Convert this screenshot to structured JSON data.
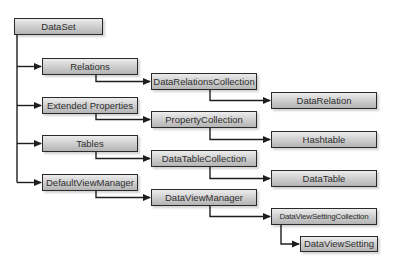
{
  "diagram": {
    "nodes": [
      {
        "id": "dataset",
        "label": "DataSet"
      },
      {
        "id": "relations",
        "label": "Relations"
      },
      {
        "id": "datarelationscollection",
        "label": "DataRelationsCollection"
      },
      {
        "id": "datarelation",
        "label": "DataRelation"
      },
      {
        "id": "extendedproperties",
        "label": "Extended Properties"
      },
      {
        "id": "propertycollection",
        "label": "PropertyCollection"
      },
      {
        "id": "hashtable",
        "label": "Hashtable"
      },
      {
        "id": "tables",
        "label": "Tables"
      },
      {
        "id": "datatablecollection",
        "label": "DataTableCollection"
      },
      {
        "id": "datatable",
        "label": "DataTable"
      },
      {
        "id": "defaultviewmanager",
        "label": "DefaultViewManager"
      },
      {
        "id": "dataviewmanager",
        "label": "DataViewManager"
      },
      {
        "id": "dataviewsettingcollection",
        "label": "DataViewSettingCollection"
      },
      {
        "id": "dataviewsetting",
        "label": "DataViewSetting"
      }
    ],
    "edges": [
      {
        "from": "dataset",
        "to": "relations"
      },
      {
        "from": "dataset",
        "to": "extendedproperties"
      },
      {
        "from": "dataset",
        "to": "tables"
      },
      {
        "from": "dataset",
        "to": "defaultviewmanager"
      },
      {
        "from": "relations",
        "to": "datarelationscollection"
      },
      {
        "from": "datarelationscollection",
        "to": "datarelation"
      },
      {
        "from": "extendedproperties",
        "to": "propertycollection"
      },
      {
        "from": "propertycollection",
        "to": "hashtable"
      },
      {
        "from": "tables",
        "to": "datatablecollection"
      },
      {
        "from": "datatablecollection",
        "to": "datatable"
      },
      {
        "from": "defaultviewmanager",
        "to": "dataviewmanager"
      },
      {
        "from": "dataviewmanager",
        "to": "dataviewsettingcollection"
      },
      {
        "from": "dataviewsettingcollection",
        "to": "dataviewsetting"
      }
    ],
    "colors": {
      "line": "#1e1e1e",
      "border": "#2a2a2a",
      "text": "#2e2e2e"
    }
  }
}
